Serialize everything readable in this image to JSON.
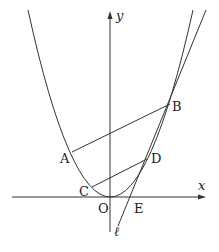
{
  "diagram": {
    "axes": {
      "x_label": "x",
      "y_label": "y"
    },
    "curve": "parabola",
    "line_label": "ℓ",
    "points": {
      "A": "A",
      "B": "B",
      "C": "C",
      "D": "D",
      "E": "E",
      "O": "O"
    }
  }
}
